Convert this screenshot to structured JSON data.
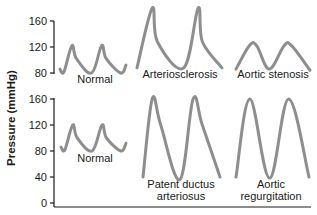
{
  "chart_data": {
    "type": "line",
    "title": "",
    "ylabel": "Pressure (mmHg)",
    "xlabel": "",
    "colors": {
      "wave": "#8e8e8e",
      "axis": "#1a1a1a"
    },
    "panels": [
      {
        "name": "top",
        "ylim": [
          80,
          160
        ],
        "yticks": [
          160,
          120,
          80
        ],
        "waveforms": [
          {
            "label": [
              "Normal"
            ],
            "points_mmHg": [
              [
                0,
                86
              ],
              [
                0.06,
                82
              ],
              [
                0.18,
                122
              ],
              [
                0.25,
                102
              ],
              [
                0.48,
                80
              ],
              [
                0.63,
                122
              ],
              [
                0.7,
                102
              ],
              [
                0.92,
                80
              ],
              [
                1.0,
                92
              ]
            ]
          },
          {
            "label": [
              "Arteriosclerosis"
            ],
            "points_mmHg": [
              [
                0,
                88
              ],
              [
                0.18,
                180
              ],
              [
                0.24,
                128
              ],
              [
                0.55,
                88
              ],
              [
                0.72,
                180
              ],
              [
                0.77,
                128
              ],
              [
                1.0,
                88
              ]
            ]
          },
          {
            "label": [
              "Aortic stenosis"
            ],
            "points_mmHg": [
              [
                0,
                86
              ],
              [
                0.18,
                122
              ],
              [
                0.28,
                122
              ],
              [
                0.45,
                86
              ],
              [
                0.65,
                122
              ],
              [
                0.75,
                122
              ],
              [
                1.0,
                84
              ]
            ]
          }
        ]
      },
      {
        "name": "bottom",
        "ylim": [
          0,
          160
        ],
        "yticks": [
          160,
          120,
          80,
          40,
          0
        ],
        "waveforms": [
          {
            "label": [
              "Normal"
            ],
            "points_mmHg": [
              [
                0,
                86
              ],
              [
                0.06,
                82
              ],
              [
                0.18,
                120
              ],
              [
                0.25,
                100
              ],
              [
                0.48,
                80
              ],
              [
                0.63,
                120
              ],
              [
                0.7,
                100
              ],
              [
                0.92,
                80
              ],
              [
                1.0,
                92
              ]
            ]
          },
          {
            "label": [
              "Patent ductus",
              "arteriosus"
            ],
            "points_mmHg": [
              [
                0,
                40
              ],
              [
                0.12,
                160
              ],
              [
                0.23,
                120
              ],
              [
                0.48,
                36
              ],
              [
                0.65,
                160
              ],
              [
                0.77,
                120
              ],
              [
                1.0,
                40
              ]
            ]
          },
          {
            "label": [
              "Aortic",
              "regurgitation"
            ],
            "points_mmHg": [
              [
                0,
                40
              ],
              [
                0.19,
                160
              ],
              [
                0.46,
                38
              ],
              [
                0.72,
                160
              ],
              [
                1.0,
                40
              ]
            ]
          }
        ]
      }
    ],
    "tick_labels": {
      "top": [
        "160",
        "120",
        "80"
      ],
      "bottom": [
        "160",
        "120",
        "80",
        "40",
        "0"
      ]
    }
  }
}
